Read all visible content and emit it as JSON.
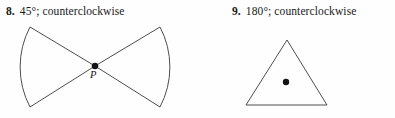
{
  "document": {
    "type": "geometry-exercise",
    "background_color": "#fefefe",
    "ink_color": "#3a3a3a",
    "text_color": "#1a1a1a"
  },
  "problems": [
    {
      "number": "8.",
      "prompt": "45°; counterclockwise",
      "angle": "45°",
      "direction": "counterclockwise",
      "figure": {
        "shape_name": "bowtie-double-sector",
        "description": "Two circular sectors meeting point-to-point at center P, opening left and right",
        "center_point_label": "P",
        "center_point": {
          "x": 95,
          "y": 66
        },
        "left_sector": {
          "arc_top": {
            "x": 30,
            "y": 27
          },
          "arc_bottom": {
            "x": 30,
            "y": 107
          },
          "arc_extreme_x": 20
        },
        "right_sector": {
          "arc_top": {
            "x": 160,
            "y": 27
          },
          "arc_bottom": {
            "x": 160,
            "y": 107
          },
          "arc_extreme_x": 170
        }
      }
    },
    {
      "number": "9.",
      "prompt": "180°; counterclockwise",
      "angle": "180°",
      "direction": "counterclockwise",
      "figure": {
        "shape_name": "triangle",
        "description": "Isosceles triangle with interior point P",
        "center_point_label": "P",
        "center_point": {
          "x": 286,
          "y": 82
        },
        "vertices": [
          {
            "x": 287,
            "y": 40
          },
          {
            "x": 327,
            "y": 105
          },
          {
            "x": 246,
            "y": 105
          }
        ]
      }
    }
  ]
}
